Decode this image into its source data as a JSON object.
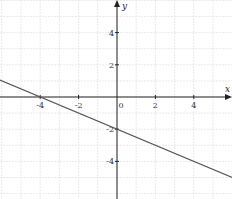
{
  "chart_data": {
    "type": "line",
    "title": "",
    "xlabel": "x",
    "ylabel": "y",
    "xlim": [
      -6.1,
      6.0
    ],
    "ylim": [
      -6.2,
      6.0
    ],
    "grid": true,
    "x_ticks": [
      -4,
      -2,
      0,
      2,
      4
    ],
    "y_ticks": [
      4,
      2,
      -2,
      -4
    ],
    "x_tick_labels": [
      "-4",
      "-2",
      "0",
      "2",
      "4"
    ],
    "y_tick_labels": [
      "4",
      "2",
      "-2",
      "-4"
    ],
    "series": [
      {
        "name": "y = -0.5x - 2",
        "equation": "y = -x/2 - 2",
        "slope": -0.5,
        "intercept": -2,
        "x_intercept": -4,
        "x": [
          -6.1,
          6.0
        ],
        "values": [
          1.05,
          -5.0
        ]
      }
    ],
    "colors": {
      "axis": "#222222",
      "grid": "#e4e4e4",
      "line": "#555555"
    }
  }
}
